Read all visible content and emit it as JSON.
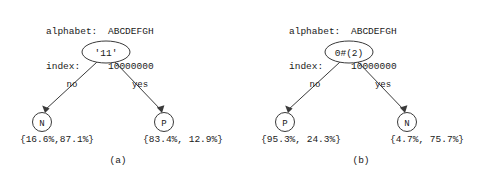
{
  "figure": {
    "panels": [
      {
        "id": "a",
        "caption": "(a)",
        "header": {
          "alphabet_key": "alphabet:",
          "alphabet_value": "ABCDEFGH",
          "index_key": "index:",
          "index_value": "10000000"
        },
        "root": {
          "label": "'11'",
          "shape": "ellipse"
        },
        "edges": {
          "left_label": "no",
          "right_label": "yes"
        },
        "left_leaf": {
          "label": "N",
          "shape": "circle",
          "percentages": "{16.6%,87.1%}"
        },
        "right_leaf": {
          "label": "P",
          "shape": "circle",
          "percentages": "{83.4%, 12.9%}"
        }
      },
      {
        "id": "b",
        "caption": "(b)",
        "header": {
          "alphabet_key": "alphabet:",
          "alphabet_value": "ABCDEFGH",
          "index_key": "index:",
          "index_value": "10000000"
        },
        "root": {
          "label": "0#(2)",
          "shape": "ellipse"
        },
        "edges": {
          "left_label": "no",
          "right_label": "yes"
        },
        "left_leaf": {
          "label": "P",
          "shape": "circle",
          "percentages": "{95.3%, 24.3%}"
        },
        "right_leaf": {
          "label": "N",
          "shape": "circle",
          "percentages": "{4.7%, 75.7%}"
        }
      }
    ],
    "colors": {
      "background": "#ffffff",
      "stroke": "#3a3a3a",
      "text": "#1a1a1a"
    }
  }
}
